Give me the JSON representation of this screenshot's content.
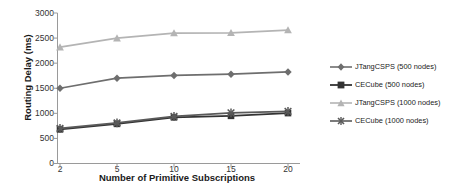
{
  "chart_data": {
    "type": "line",
    "title": "",
    "subtitle": "",
    "xlabel": "Number of Primitive Subscriptions",
    "ylabel": "Routing Delay (ms)",
    "categories": [
      "2",
      "5",
      "10",
      "15",
      "20"
    ],
    "ylim": [
      0,
      3000
    ],
    "yticks": [
      "0",
      "500",
      "1000",
      "1500",
      "2000",
      "2500",
      "3000"
    ],
    "ytick_values": [
      0,
      500,
      1000,
      1500,
      2000,
      2500,
      3000
    ],
    "grid": false,
    "legend_position": "right",
    "series": [
      {
        "name": "JTangCSPS (500 nodes)",
        "values": [
          1500,
          1700,
          1755,
          1780,
          1825
        ],
        "color": "#6e6e6e",
        "marker": "diamond"
      },
      {
        "name": "CECube (500 nodes)",
        "values": [
          680,
          790,
          920,
          950,
          1005
        ],
        "color": "#333333",
        "marker": "square"
      },
      {
        "name": "JTangCSPS (1000 nodes)",
        "values": [
          2320,
          2500,
          2600,
          2605,
          2660
        ],
        "color": "#b4b4b4",
        "marker": "triangle"
      },
      {
        "name": "CECube (1000 nodes)",
        "values": [
          700,
          810,
          940,
          1010,
          1040
        ],
        "color": "#5a5a5a",
        "marker": "cross"
      }
    ]
  },
  "axes": {
    "axis_color": "#9a9a9a",
    "text_color": "#333333",
    "title_color": "#1a1a1a"
  }
}
